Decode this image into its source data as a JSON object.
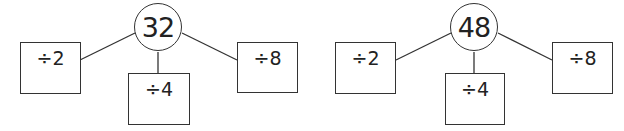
{
  "diagrams": [
    {
      "root": "32",
      "branches": [
        {
          "label": "÷2",
          "answer": ""
        },
        {
          "label": "÷4",
          "answer": ""
        },
        {
          "label": "÷8",
          "answer": ""
        }
      ]
    },
    {
      "root": "48",
      "branches": [
        {
          "label": "÷2",
          "answer": ""
        },
        {
          "label": "÷4",
          "answer": ""
        },
        {
          "label": "÷8",
          "answer": ""
        }
      ]
    }
  ],
  "colors": {
    "stroke": "#333333",
    "background": "#ffffff"
  }
}
